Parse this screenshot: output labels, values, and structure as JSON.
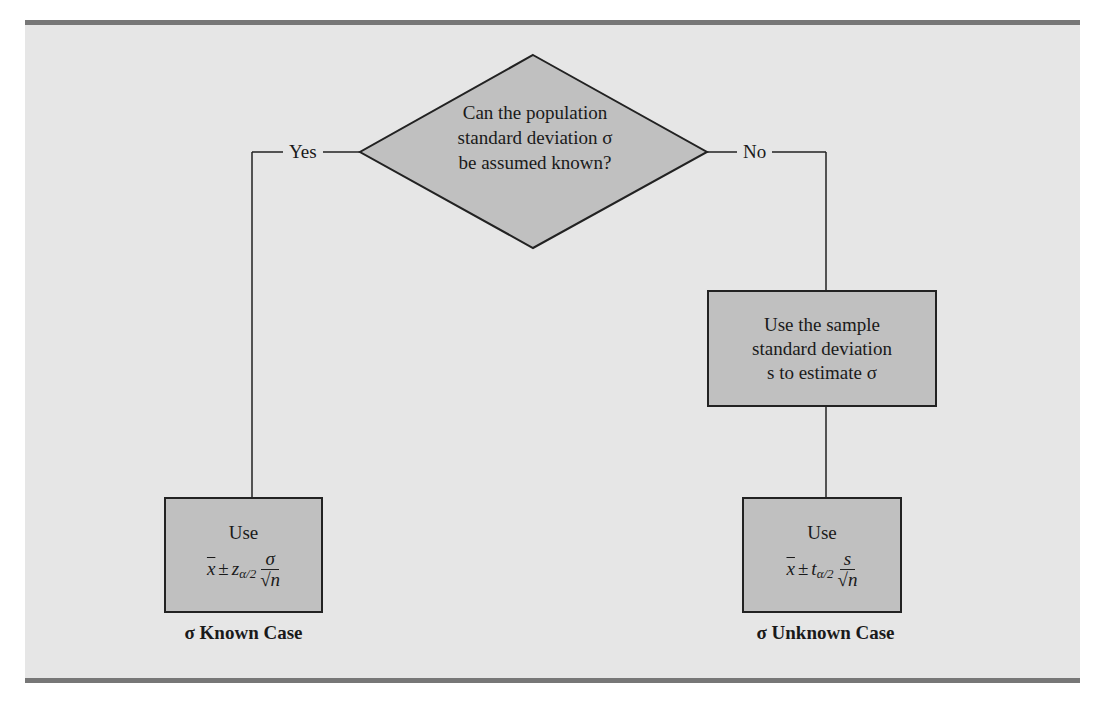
{
  "diagram": {
    "decision": {
      "lines": [
        "Can the population",
        "standard deviation σ",
        "be assumed known?"
      ]
    },
    "branches": {
      "yes_label": "Yes",
      "no_label": "No"
    },
    "process_box": {
      "lines": [
        "Use the sample",
        "standard deviation",
        "s to estimate σ"
      ]
    },
    "known_box": {
      "use_label": "Use",
      "xbar": "x",
      "pm": "±",
      "stat": "z",
      "subscript": "α/2",
      "numerator": "σ",
      "denominator": "√n",
      "caption": "σ Known Case"
    },
    "unknown_box": {
      "use_label": "Use",
      "xbar": "x",
      "pm": "±",
      "stat": "t",
      "subscript": "α/2",
      "numerator": "s",
      "denominator": "√n",
      "caption": "σ Unknown Case"
    },
    "colors": {
      "panel_bg": "#e6e6e6",
      "box_fill": "#c0c0c0",
      "rule": "#777777",
      "stroke": "#222222"
    }
  }
}
